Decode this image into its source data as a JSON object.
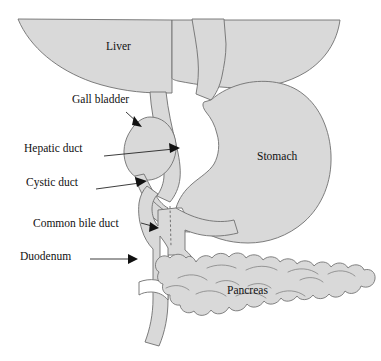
{
  "figure": {
    "background_color": "#ffffff",
    "organ_fill_color": "#d9d9d9",
    "organ_stroke_color": "#6f6f6f",
    "label_color": "#111111"
  },
  "organ_labels": [
    {
      "id": "liver",
      "text": "Liver",
      "x": 106,
      "y": 48
    },
    {
      "id": "stomach",
      "text": "Stomach",
      "x": 257,
      "y": 158
    },
    {
      "id": "pancreas",
      "text": "Pancreas",
      "x": 227,
      "y": 292
    }
  ],
  "callouts": [
    {
      "id": "gall-bladder",
      "text": "Gall bladder",
      "label_x": 72,
      "label_y": 100,
      "leader": {
        "x1": 126,
        "y1": 112,
        "x2": 140,
        "y2": 125
      },
      "arrow_angle": 44
    },
    {
      "id": "hepatic-duct",
      "text": "Hepatic duct",
      "label_x": 24,
      "label_y": 149,
      "leader": {
        "x1": 104,
        "y1": 156,
        "x2": 178,
        "y2": 148
      },
      "arrow_angle": -6
    },
    {
      "id": "cystic-duct",
      "text": "Cystic duct",
      "label_x": 26,
      "label_y": 183,
      "leader": {
        "x1": 96,
        "y1": 189,
        "x2": 144,
        "y2": 182
      },
      "arrow_angle": -8
    },
    {
      "id": "common-bile-duct",
      "text": "Common bile duct",
      "label_x": 33,
      "label_y": 224,
      "leader": {
        "x1": 141,
        "y1": 224,
        "x2": 155,
        "y2": 228
      },
      "arrow_angle": 16
    },
    {
      "id": "duodenum",
      "text": "Duodenum",
      "label_x": 20,
      "label_y": 257,
      "leader": {
        "x1": 90,
        "y1": 259,
        "x2": 136,
        "y2": 259
      },
      "arrow_angle": 0
    }
  ],
  "structures": [
    {
      "id": "liver",
      "name": "Liver",
      "kind": "organ"
    },
    {
      "id": "stomach",
      "name": "Stomach",
      "kind": "organ"
    },
    {
      "id": "esophagus",
      "name": "Esophagus",
      "kind": "organ"
    },
    {
      "id": "gall-bladder",
      "name": "Gall bladder",
      "kind": "organ"
    },
    {
      "id": "hepatic-duct",
      "name": "Hepatic duct",
      "kind": "duct"
    },
    {
      "id": "cystic-duct",
      "name": "Cystic duct",
      "kind": "duct"
    },
    {
      "id": "common-bile-duct",
      "name": "Common bile duct",
      "kind": "duct"
    },
    {
      "id": "duodenum",
      "name": "Duodenum",
      "kind": "organ"
    },
    {
      "id": "pancreas",
      "name": "Pancreas",
      "kind": "organ"
    }
  ]
}
